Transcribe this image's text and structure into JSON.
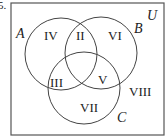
{
  "question_number": "5.",
  "universe_label": "U",
  "sets": [
    {
      "label": "A",
      "cx": 61,
      "cy": 54,
      "r": 36
    },
    {
      "label": "B",
      "cx": 101,
      "cy": 53,
      "r": 36
    },
    {
      "label": "C",
      "cx": 84,
      "cy": 88,
      "r": 36
    }
  ],
  "regions": [
    {
      "label": "I",
      "x": 84,
      "y": 0
    },
    {
      "label": "II",
      "x": 82,
      "y": 40
    },
    {
      "label": "III",
      "x": 58,
      "y": 88
    },
    {
      "label": "IV",
      "x": 52,
      "y": 40
    },
    {
      "label": "V",
      "x": 103,
      "y": 85
    },
    {
      "label": "VI",
      "x": 119,
      "y": 40
    },
    {
      "label": "VII",
      "x": 87,
      "y": 113
    },
    {
      "label": "VIII",
      "x": 140,
      "y": 96
    }
  ],
  "colors": {
    "stroke": "#444444",
    "text": "#222222",
    "background": "#ffffff"
  }
}
